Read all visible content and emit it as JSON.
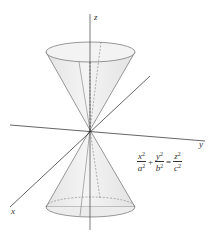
{
  "figure": {
    "axes": {
      "x_label": "x",
      "y_label": "y",
      "z_label": "z"
    },
    "equation": {
      "terms": [
        {
          "num": "x",
          "den": "a"
        },
        {
          "num": "y",
          "den": "b"
        }
      ],
      "rhs": {
        "num": "z",
        "den": "c"
      },
      "exponent": "2",
      "plus": "+",
      "equals": "="
    }
  }
}
